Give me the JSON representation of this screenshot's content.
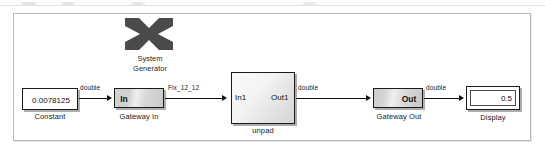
{
  "diagram": {
    "canvas_bg": "#ffffff",
    "wire_color": "#111111",
    "frame_color": "#b9b9b9"
  },
  "sysgen_token": {
    "icon": "xilinx-x-logo",
    "line1": "System",
    "line2": "Generator",
    "logo_color": "#4a4a4a"
  },
  "blocks": {
    "constant": {
      "value": "0.0078125",
      "label": "Constant"
    },
    "gateway_in": {
      "port_text": "In",
      "label": "Gateway In"
    },
    "unpad": {
      "in_port": "In1",
      "out_port": "Out1",
      "label": "unpad"
    },
    "gateway_out": {
      "port_text": "Out",
      "label": "Gateway Out"
    },
    "display": {
      "value": "0.5",
      "label": "Display"
    }
  },
  "signals": [
    {
      "name": "constant-to-gatewayin",
      "type_label": "double"
    },
    {
      "name": "gatewayin-to-unpad",
      "type_label": "Fix_12_12"
    },
    {
      "name": "unpad-to-gatewayout",
      "type_label": "double"
    },
    {
      "name": "gatewayout-to-display",
      "type_label": "double"
    }
  ]
}
